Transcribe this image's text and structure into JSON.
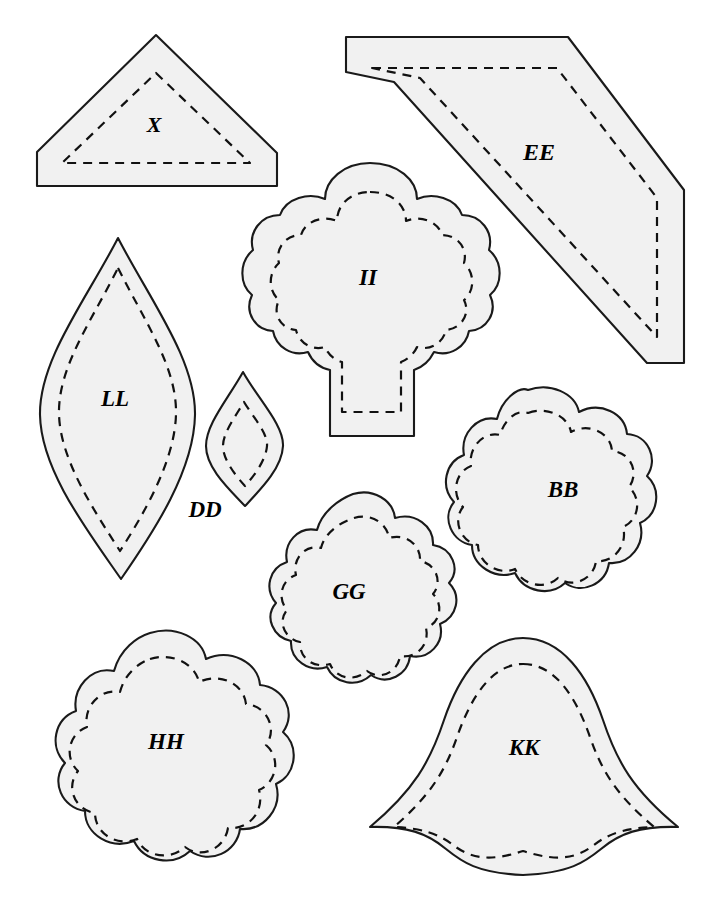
{
  "sheet": {
    "title": "Applique Pattern Template Sheet",
    "background_color": "#ffffff",
    "piece_fill_color": "#f1f1f1",
    "outline_color": "#1a1a1a",
    "seam_line_color": "#111111",
    "seam_line_style": "dashed",
    "piece_count": 9
  },
  "pieces": [
    {
      "id": "X",
      "label": "X",
      "shape_description": "triangle with truncated bottom corners (pentagon peak)",
      "label_x": 154,
      "label_y": 127,
      "label_size": 22,
      "bbox": [
        37,
        35,
        277,
        186
      ]
    },
    {
      "id": "EE",
      "label": "EE",
      "shape_description": "elongated slanted hexagon / parallelogram band",
      "label_x": 539,
      "label_y": 154,
      "label_size": 24,
      "bbox": [
        346,
        37,
        684,
        364
      ]
    },
    {
      "id": "II",
      "label": "II",
      "shape_description": "tree / broccoli with scalloped crown and trunk",
      "label_x": 368,
      "label_y": 280,
      "label_size": 23,
      "bbox": [
        247,
        163,
        495,
        437
      ]
    },
    {
      "id": "LL",
      "label": "LL",
      "shape_description": "large pointed leaf / lens",
      "label_x": 115,
      "label_y": 401,
      "label_size": 23,
      "bbox": [
        40,
        238,
        196,
        579
      ]
    },
    {
      "id": "DD",
      "label": "DD",
      "shape_description": "small pointed leaf / lens",
      "label_x": 205,
      "label_y": 512,
      "label_size": 23,
      "bbox": [
        206,
        372,
        284,
        506
      ]
    },
    {
      "id": "BB",
      "label": "BB",
      "shape_description": "scalloped flower circle (9 lobes)",
      "label_x": 563,
      "label_y": 492,
      "label_size": 23,
      "bbox": [
        435,
        390,
        648,
        597
      ]
    },
    {
      "id": "GG",
      "label": "GG",
      "shape_description": "small scalloped flower oval (9 lobes)",
      "label_x": 349,
      "label_y": 594,
      "label_size": 23,
      "bbox": [
        261,
        494,
        455,
        764
      ]
    },
    {
      "id": "HH",
      "label": "HH",
      "shape_description": "large scalloped flower circle (9 lobes)",
      "label_x": 166,
      "label_y": 744,
      "label_size": 23,
      "bbox": [
        38,
        632,
        300,
        884
      ]
    },
    {
      "id": "KK",
      "label": "KK",
      "shape_description": "bell / tent with concave flared sides and pointed base",
      "label_x": 524,
      "label_y": 750,
      "label_size": 23,
      "bbox": [
        370,
        638,
        678,
        875
      ]
    }
  ]
}
